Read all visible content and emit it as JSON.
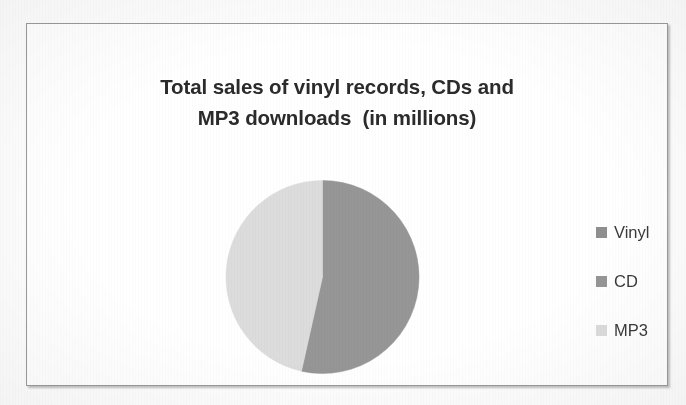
{
  "frame": {
    "border_color": "#9a9a9a",
    "background": "#ffffff"
  },
  "chart_data": {
    "type": "pie",
    "title": "Total sales of vinyl records, CDs and MP3 downloads (in millions)",
    "title_lines": [
      "Total sales of vinyl records, CDs and",
      "MP3 downloads  (in millions)"
    ],
    "categories": [
      "Vinyl",
      "CD",
      "MP3"
    ],
    "values": [
      0,
      53.5,
      46.5
    ],
    "percentages": [
      "0%",
      "53.5%",
      "46.5%"
    ],
    "colors": [
      "#8f8f8f",
      "#969696",
      "#dcdcdc"
    ],
    "start_angle_deg": 0,
    "direction": "clockwise",
    "legend_position": "right",
    "grid": false,
    "xlabel": "",
    "ylabel": "",
    "data_labels_shown": false,
    "slices": [
      {
        "label": "Vinyl",
        "value": 0,
        "percent": "0%",
        "color": "#8f8f8f",
        "start_deg": 0,
        "end_deg": 0
      },
      {
        "label": "CD",
        "value": 53.5,
        "percent": "53.5%",
        "color": "#969696",
        "start_deg": 0,
        "end_deg": 192.6
      },
      {
        "label": "MP3",
        "value": 46.5,
        "percent": "46.5%",
        "color": "#dcdcdc",
        "start_deg": 192.6,
        "end_deg": 360
      }
    ]
  },
  "legend": {
    "items": [
      {
        "label": "Vinyl",
        "color": "#8f8f8f",
        "swatch_icon": "legend-swatch-icon"
      },
      {
        "label": "CD",
        "color": "#969696",
        "swatch_icon": "legend-swatch-icon"
      },
      {
        "label": "MP3",
        "color": "#dcdcdc",
        "swatch_icon": "legend-swatch-icon"
      }
    ]
  }
}
